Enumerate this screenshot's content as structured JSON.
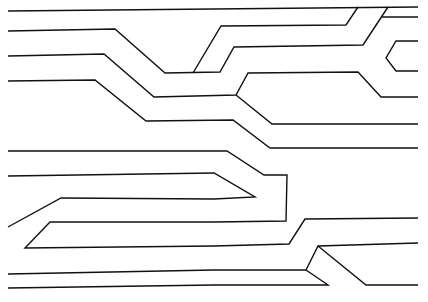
{
  "diagram": {
    "type": "line-drawing",
    "stroke_color": "#111111",
    "background": "#ffffff",
    "lines": [
      "8,11 418,7",
      "8,31 115,29 165,73 220,72 234,47 363,45 388,7",
      "193,73 221,26 346,25 358,7",
      "418,17 382,17",
      "418,41 396,41 386,58 396,71 418,71",
      "8,56 104,54 154,97 236,95 248,73 358,72 381,97 418,97",
      "236,95 272,124 418,124",
      "8,81 95,80 146,121 233,120 270,148 418,148",
      "8,151 227,151 264,175 287,175 286,221 214,222 50,222 25,248 214,246 289,244 305,219 418,218",
      "8,176 214,173 255,197 214,199 61,198 8,227",
      "8,274 214,270 306,270 318,246 418,243",
      "8,288 214,285 328,285 306,270",
      "318,246 366,285 418,285"
    ]
  }
}
